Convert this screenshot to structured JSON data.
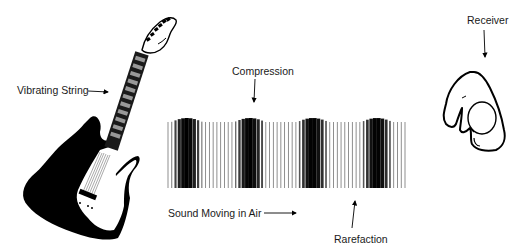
{
  "diagram": {
    "labels": {
      "vibrating_string": "Vibrating String",
      "compression": "Compression",
      "sound_moving": "Sound Moving in Air",
      "rarefaction": "Rarefaction",
      "receiver": "Receiver"
    },
    "components": {
      "source": "guitar-icon",
      "medium": "air-pressure-wave",
      "receiver": "ear-icon"
    },
    "wave": {
      "x_start": 168,
      "x_end": 405,
      "y_top": 118,
      "y_bottom": 188,
      "bar_count": 64,
      "compression_centers": [
        187,
        250,
        313,
        377
      ],
      "ink_color": "#000000"
    }
  }
}
